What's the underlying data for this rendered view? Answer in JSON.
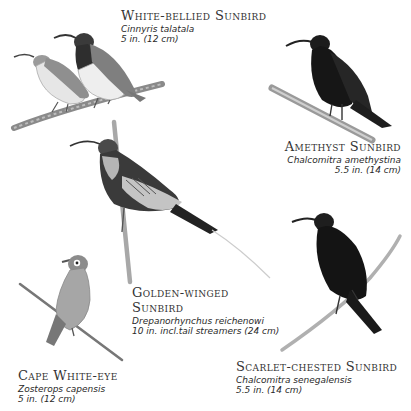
{
  "plate": {
    "background": "#ffffff",
    "text_color": "#333333",
    "birds": [
      {
        "name": "White-bellied Sunbird",
        "scientific": "Cinnyris talatala",
        "size": "5 in. (12 cm)"
      },
      {
        "name": "Amethyst Sunbird",
        "scientific": "Chalcomitra amethystina",
        "size": "5.5 in. (14 cm)"
      },
      {
        "name_line1": "Golden-winged",
        "name_line2": "Sunbird",
        "scientific": "Drepanorhynchus reichenowi",
        "size": "10 in. incl.tail streamers (24 cm)"
      },
      {
        "name": "Cape White-eye",
        "scientific": "Zosterops capensis",
        "size": "5 in. (12 cm)"
      },
      {
        "name": "Scarlet-chested Sunbird",
        "scientific": "Chalcomitra senegalensis",
        "size": "5.5 in. (14 cm)"
      }
    ]
  }
}
